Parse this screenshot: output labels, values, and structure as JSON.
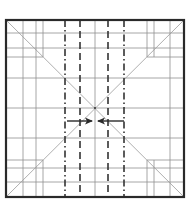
{
  "diagram": {
    "type": "origami-crease-pattern",
    "colors": {
      "border": "#2a2a2a",
      "crease": "#8a8a8a",
      "fold_line": "#3a3a3a",
      "arrow": "#2a2a2a",
      "background": "#ffffff"
    },
    "square": {
      "x": 6,
      "y": 20,
      "size_w": 178,
      "size_h": 177
    },
    "center": {
      "x": 95,
      "y": 108
    },
    "thin_verticals": [
      23,
      36,
      95,
      170
    ],
    "short_verticals_top": [
      {
        "x": 43,
        "y1": 20,
        "y2": 57
      },
      {
        "x": 147,
        "y1": 20,
        "y2": 57
      },
      {
        "x": 154,
        "y1": 20,
        "y2": 57
      }
    ],
    "short_verticals_bottom": [
      {
        "x": 43,
        "y1": 160,
        "y2": 197
      },
      {
        "x": 147,
        "y1": 160,
        "y2": 197
      },
      {
        "x": 154,
        "y1": 160,
        "y2": 197
      }
    ],
    "thin_horizontals": [
      33,
      48,
      78,
      108,
      138,
      168,
      182
    ],
    "short_horizontals": [
      {
        "y": 57,
        "x1": 6,
        "x2": 43
      },
      {
        "y": 57,
        "x1": 147,
        "x2": 184
      },
      {
        "y": 160,
        "x1": 6,
        "x2": 43
      },
      {
        "y": 160,
        "x1": 147,
        "x2": 184
      }
    ],
    "dash_dot_lines": [
      65,
      124
    ],
    "dashed_lines": [
      80,
      108
    ],
    "arrows": [
      {
        "direction": "right",
        "from_x": 67,
        "to_x": 92,
        "y": 121
      },
      {
        "direction": "left",
        "from_x": 124,
        "to_x": 98,
        "y": 121
      }
    ]
  }
}
